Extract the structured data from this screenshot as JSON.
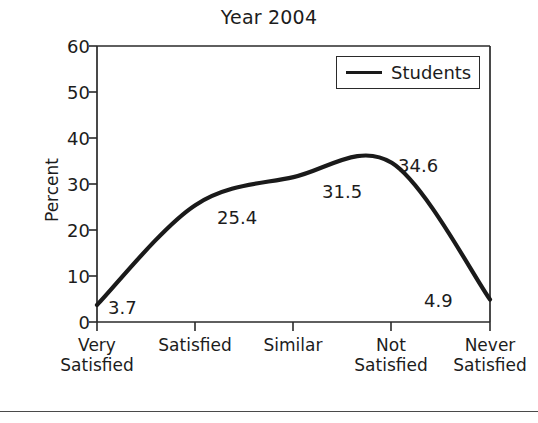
{
  "chart_data": {
    "type": "line",
    "title": "Year 2004",
    "xlabel": "",
    "ylabel": "Percent",
    "ylim": [
      0,
      60
    ],
    "yticks": [
      0,
      10,
      20,
      30,
      40,
      50,
      60
    ],
    "ytick_labels": [
      "0",
      "10",
      "20",
      "30",
      "40",
      "50",
      "60"
    ],
    "grid": false,
    "legend_position": "top-right",
    "categories": [
      "Very\nSatisfied",
      "Satisfied",
      "Similar",
      "Not\nSatisfied",
      "Never\nSatisfied"
    ],
    "series": [
      {
        "name": "Students",
        "values": [
          3.7,
          25.4,
          31.5,
          34.6,
          4.9
        ],
        "color": "#1a1a1a"
      }
    ],
    "point_labels": [
      "3.7",
      "25.4",
      "31.5",
      "34.6",
      "4.9"
    ]
  },
  "legend": {
    "entries": [
      {
        "label": "Students"
      }
    ]
  },
  "axis": {
    "y_title": "Percent"
  }
}
